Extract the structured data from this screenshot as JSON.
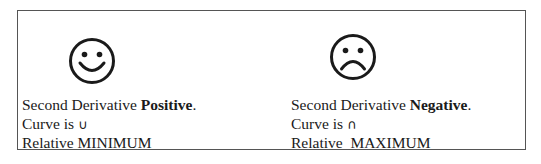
{
  "panels": [
    {
      "face_icon": "happy-face-icon",
      "line1_prefix": "Second Derivative ",
      "line1_bold": "Positive",
      "line1_suffix": ".",
      "line2_prefix": "Curve is ",
      "line2_symbol": "∪",
      "line3": "Relative MINIMUM"
    },
    {
      "face_icon": "sad-face-icon",
      "line1_prefix": "Second Derivative ",
      "line1_bold": "Negative",
      "line1_suffix": ".",
      "line2_prefix": "Curve is ",
      "line2_symbol": "∩",
      "line3": "Relative  MAXIMUM"
    }
  ],
  "colors": {
    "ink": "#1a1a1a",
    "border": "#555555",
    "background": "#ffffff"
  }
}
